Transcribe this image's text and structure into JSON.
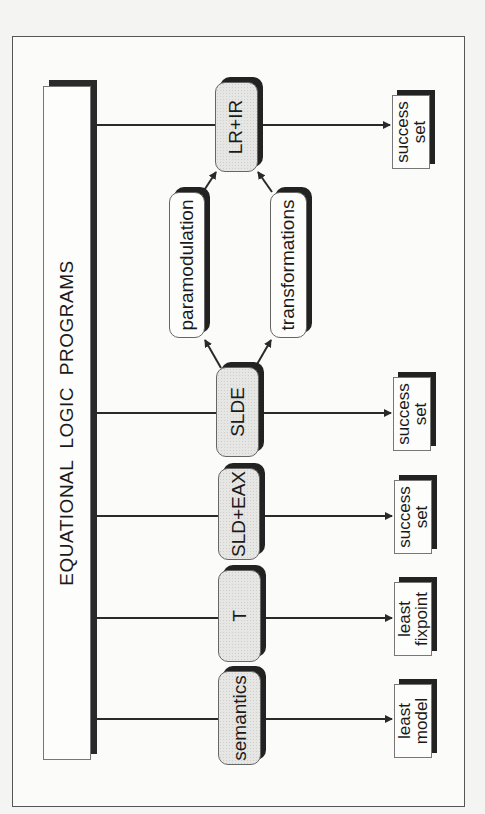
{
  "diagram": {
    "title": "EQUATIONAL LOGIC PROGRAMS",
    "colors": {
      "line": "#2a2a2a",
      "shadow": "#222222",
      "node_fill": "#e6e6e4",
      "box_fill": "#fdfdfb"
    },
    "rows": [
      {
        "id": "lr-ir",
        "method": "LR+IR",
        "result_line1": "success",
        "result_line2": "set",
        "result": "success\nset"
      },
      {
        "id": "slde",
        "method": "SLDE",
        "result_line1": "success",
        "result_line2": "set",
        "result": "success\nset"
      },
      {
        "id": "sld-eax",
        "method": "SLD+EAX",
        "result_line1": "success",
        "result_line2": "set",
        "result": "success\nset"
      },
      {
        "id": "t",
        "method": "T",
        "result_line1": "least",
        "result_line2": "fixpoint",
        "result": "least\nfixpoint"
      },
      {
        "id": "semantics",
        "method": "semantics",
        "result_line1": "least",
        "result_line2": "model",
        "result": "least\nmodel"
      }
    ],
    "intermediate": {
      "left": "paramodulation",
      "right": "transformations"
    },
    "edges": [
      {
        "from": "EQUATIONAL LOGIC PROGRAMS",
        "to": "LR+IR"
      },
      {
        "from": "EQUATIONAL LOGIC PROGRAMS",
        "to": "SLDE"
      },
      {
        "from": "EQUATIONAL LOGIC PROGRAMS",
        "to": "SLD+EAX"
      },
      {
        "from": "EQUATIONAL LOGIC PROGRAMS",
        "to": "T"
      },
      {
        "from": "EQUATIONAL LOGIC PROGRAMS",
        "to": "semantics"
      },
      {
        "from": "LR+IR",
        "to": "success set"
      },
      {
        "from": "SLDE",
        "to": "success set"
      },
      {
        "from": "SLD+EAX",
        "to": "success set"
      },
      {
        "from": "T",
        "to": "least fixpoint"
      },
      {
        "from": "semantics",
        "to": "least model"
      },
      {
        "from": "SLDE",
        "to": "paramodulation"
      },
      {
        "from": "SLDE",
        "to": "transformations"
      },
      {
        "from": "paramodulation",
        "to": "LR+IR"
      },
      {
        "from": "transformations",
        "to": "LR+IR"
      }
    ]
  }
}
